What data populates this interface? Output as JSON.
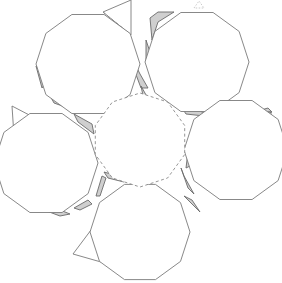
{
  "diagram": {
    "title": "",
    "colors": {
      "background": "#ffffff",
      "line": "#7a7a7a",
      "dashed_line": "#8a8a8a",
      "tab_shade": "#cfcfcf"
    },
    "center_face": {
      "cx": 140,
      "cy": 140,
      "r": 47,
      "sides": 10,
      "rotation": 18,
      "style": "dashed"
    },
    "outer_faces": [
      {
        "name": "top-left",
        "cx": 88,
        "cy": 64,
        "r": 52,
        "sides": 10,
        "rotation": 0
      },
      {
        "name": "top-right",
        "cx": 197,
        "cy": 62,
        "r": 52,
        "sides": 10,
        "rotation": 0
      },
      {
        "name": "left",
        "cx": 46,
        "cy": 163,
        "r": 52,
        "sides": 10,
        "rotation": 0
      },
      {
        "name": "right",
        "cx": 236,
        "cy": 150,
        "r": 52,
        "sides": 10,
        "rotation": 0
      },
      {
        "name": "bottom",
        "cx": 140,
        "cy": 232,
        "r": 50,
        "sides": 10,
        "rotation": 0
      }
    ],
    "triangle_flaps": [
      {
        "points": "103,12 131,0 131,35",
        "dash_edge": "103,12 131,35"
      },
      {
        "points": "12,106 35,118 14,136",
        "dash_edge": "35,118 14,136"
      },
      {
        "points": "73,254 91,230 101,262",
        "dash_edge": "91,230 101,262"
      },
      {
        "points": "263,113 271,111 271,138",
        "dash_edge": "240,126 271,138"
      }
    ],
    "glue_tabs": [
      {
        "points": "36,66 42,88 48,80"
      },
      {
        "points": "48,92 54,103 68,108 62,96"
      },
      {
        "points": "76,106 100,108 96,112 78,110"
      },
      {
        "points": "74,114 92,124 94,134 78,122"
      },
      {
        "points": "135,64 140,74 148,88 141,88 135,72"
      },
      {
        "points": "141,86 150,102 146,110"
      },
      {
        "points": "150,18 158,12 174,12 158,22 152,40"
      },
      {
        "points": "146,40 150,52 152,64 146,62"
      },
      {
        "points": "182,108 200,108 204,116 186,114"
      },
      {
        "points": "220,116 226,108 244,106 250,118 236,116 226,120"
      },
      {
        "points": "254,112 268,108 272,112 260,116"
      },
      {
        "points": "188,152 186,168 190,166"
      },
      {
        "points": "44,210 60,216 70,214 60,210"
      },
      {
        "points": "74,208 88,200 92,204 80,210"
      },
      {
        "points": "96,196 102,176 106,178 100,196"
      },
      {
        "points": "104,172 118,176 124,182 108,178"
      },
      {
        "points": "181,168 188,188 194,194 184,176"
      },
      {
        "points": "184,196 192,200 200,212 194,206"
      }
    ],
    "marks": [
      {
        "name": "small-triangle-marker",
        "points": "194,8 199,1 204,8"
      }
    ]
  }
}
